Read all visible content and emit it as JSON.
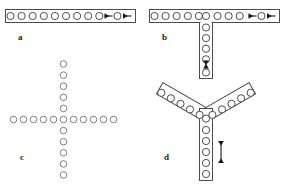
{
  "figure": {
    "type": "scientific-diagram",
    "background_color": "#ffffff",
    "outline_color": "#3a3a3a",
    "bead_fill": "#ffffff",
    "arrow_color": "#1a1a1a",
    "panels": [
      {
        "id": "a",
        "label": "a",
        "label_x": 18,
        "label_y": 33,
        "topology": "linear-chain",
        "arms": [
          {
            "name": "horizontal-arm",
            "bead_count": 11,
            "orientation_deg": 0,
            "start_x": 10,
            "start_y": 16,
            "spacing": 11.1
          }
        ],
        "arrows": [
          {
            "name": "arrow-left-inner",
            "direction": "left",
            "x": 111,
            "y": 16,
            "length": 8
          },
          {
            "name": "arrow-left-outer",
            "direction": "left",
            "x": 130,
            "y": 16,
            "length": 8
          }
        ],
        "has_outline_box": true
      },
      {
        "id": "b",
        "label": "b",
        "label_x": 162,
        "label_y": 33,
        "topology": "T-junction",
        "arms": [
          {
            "name": "horizontal-arm",
            "bead_count": 11,
            "orientation_deg": 0,
            "start_x": 154,
            "start_y": 16,
            "spacing": 11.1
          },
          {
            "name": "vertical-arm",
            "bead_count": 6,
            "orientation_deg": 90,
            "start_x": 206,
            "start_y": 16,
            "spacing": 10.6
          }
        ],
        "arrows": [
          {
            "name": "arrow-left-inner",
            "direction": "left",
            "x": 255,
            "y": 16,
            "length": 8
          },
          {
            "name": "arrow-left-outer",
            "direction": "left",
            "x": 274,
            "y": 16,
            "length": 8
          },
          {
            "name": "arrow-vertical-stem",
            "direction": "updown",
            "x": 206,
            "y": 63,
            "length": 9
          }
        ],
        "has_outline_box": true
      },
      {
        "id": "c",
        "label": "c",
        "label_x": 20,
        "label_y": 153,
        "topology": "plus-cross",
        "arms": [
          {
            "name": "horizontal-arm",
            "bead_count": 11,
            "orientation_deg": 0,
            "start_x": 13,
            "start_y": 119,
            "spacing": 11.1
          },
          {
            "name": "vertical-arm",
            "bead_count": 11,
            "orientation_deg": 90,
            "start_x": 63,
            "start_y": 64,
            "spacing": 11.1
          }
        ],
        "arrows": [],
        "has_outline_box": false
      },
      {
        "id": "d",
        "label": "d",
        "label_x": 164,
        "label_y": 153,
        "topology": "Y-junction",
        "arms": [
          {
            "name": "upper-left-arm",
            "bead_count": 6,
            "orientation_deg": -30,
            "start_x": 158,
            "start_y": 94,
            "spacing": 11.0
          },
          {
            "name": "upper-right-arm",
            "bead_count": 6,
            "orientation_deg": 30,
            "start_x": 273,
            "start_y": 94,
            "spacing": 11.0
          },
          {
            "name": "lower-stem",
            "bead_count": 6,
            "orientation_deg": 90,
            "start_x": 206,
            "start_y": 121,
            "spacing": 11.0
          }
        ],
        "arrows": [
          {
            "name": "arrow-stem-double",
            "direction": "updown",
            "x": 221,
            "y": 152,
            "length": 22
          }
        ],
        "has_outline_box": true
      }
    ]
  }
}
